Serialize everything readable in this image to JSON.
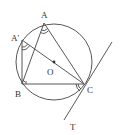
{
  "diagram": {
    "type": "geometry-circle-tangent",
    "colors": {
      "stroke": "#444444",
      "text": "#333333",
      "background": "#ffffff"
    },
    "circle": {
      "center": "O",
      "cx": 54,
      "cy": 62,
      "r": 38
    },
    "points": {
      "A": {
        "label": "A",
        "x": 44,
        "y": 23
      },
      "A'": {
        "label": "A'",
        "x": 22,
        "y": 40
      },
      "B": {
        "label": "B",
        "x": 22,
        "y": 84
      },
      "C": {
        "label": "C",
        "x": 84,
        "y": 84
      },
      "O": {
        "label": "O",
        "x": 54,
        "y": 62
      },
      "T": {
        "label": "T"
      }
    },
    "segments": [
      "AB",
      "AC",
      "BC",
      "A'B",
      "A'C (through O)"
    ],
    "tangent": {
      "at": "C",
      "label": "T"
    },
    "angle_marks": [
      "angle A (double arc)",
      "angle A' (double arc)",
      "angle BCT (double arc)",
      "right angle at B"
    ]
  },
  "labels": {
    "A": "A",
    "A_prime": "A'",
    "B": "B",
    "C": "C",
    "O": "O",
    "T": "T"
  }
}
